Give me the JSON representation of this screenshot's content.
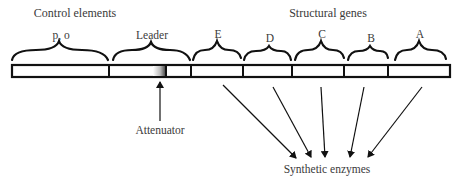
{
  "diagram": {
    "headers": {
      "control": "Control elements",
      "structural": "Structural genes"
    },
    "segments": [
      {
        "id": "po",
        "label": "p, o",
        "x1": 12,
        "x2": 109
      },
      {
        "id": "leader",
        "label": "Leader",
        "x1": 109,
        "x2": 191
      },
      {
        "id": "E",
        "label": "E",
        "x1": 191,
        "x2": 243
      },
      {
        "id": "D",
        "label": "D",
        "x1": 243,
        "x2": 292
      },
      {
        "id": "C",
        "label": "C",
        "x1": 292,
        "x2": 344
      },
      {
        "id": "B",
        "label": "B",
        "x1": 344,
        "x2": 388
      },
      {
        "id": "A",
        "label": "A",
        "x1": 388,
        "x2": 450
      }
    ],
    "attenuator": {
      "label": "Attenuator"
    },
    "product": {
      "label": "Synthetic enzymes"
    },
    "colors": {
      "line": "#111111",
      "text": "#3a3a3a",
      "bar_fill": "#ffffff"
    }
  }
}
